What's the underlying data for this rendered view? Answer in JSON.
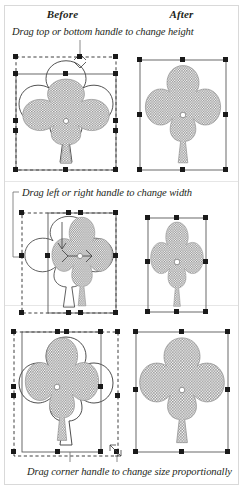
{
  "figure": {
    "columns": {
      "before": "Before",
      "after": "After"
    },
    "border_color": "#d9d9d9",
    "handle_color": "#1a1a1a",
    "shape_fill": "#9a9a9a"
  },
  "sections": [
    {
      "id": "height",
      "caption": "Drag top or bottom handle to change height",
      "before_alt": "clover-with-selection-handles-squashed-vertically",
      "after_alt": "clover-resized-shorter"
    },
    {
      "id": "width",
      "caption": "Drag left or right handle to change width",
      "before_alt": "clover-with-selection-handles-squeezed-horizontally",
      "after_alt": "clover-resized-narrower"
    },
    {
      "id": "proportional",
      "caption": "Drag corner handle to change size proportionally",
      "before_alt": "clover-with-corner-handle-dragged",
      "after_alt": "clover-resized-proportionally"
    }
  ]
}
